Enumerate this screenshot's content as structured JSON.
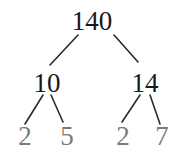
{
  "diagram": {
    "type": "factor-tree",
    "root": {
      "value": "140",
      "x": 92,
      "y": 30
    },
    "level1": [
      {
        "value": "10",
        "x": 47,
        "y": 92
      },
      {
        "value": "14",
        "x": 145,
        "y": 92
      }
    ],
    "leaves": [
      {
        "value": "2",
        "x": 25,
        "y": 145
      },
      {
        "value": "5",
        "x": 67,
        "y": 145
      },
      {
        "value": "2",
        "x": 123,
        "y": 145
      },
      {
        "value": "7",
        "x": 162,
        "y": 145
      }
    ],
    "colors": {
      "composite": "#1a1a1a",
      "prime": "#7a7a7a",
      "edge": "#2a2a2a"
    }
  }
}
